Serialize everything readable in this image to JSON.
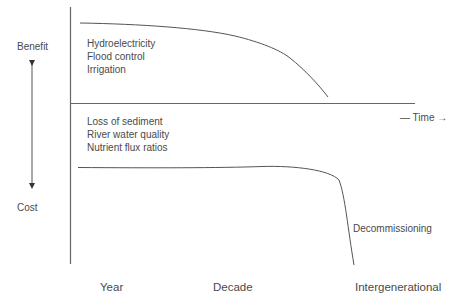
{
  "axis": {
    "y_top_label": "Benefit",
    "y_bottom_label": "Cost",
    "x_label": "— Time →"
  },
  "benefits": {
    "items": [
      "Hydroelectricity",
      "Flood control",
      "Irrigation"
    ]
  },
  "costs": {
    "items": [
      "Loss of sediment",
      "River water quality",
      "Nutrient flux ratios"
    ]
  },
  "annotations": {
    "decommissioning": "Decommissioning"
  },
  "time_scale": {
    "ticks": [
      "Year",
      "Decade",
      "Intergenerational"
    ]
  },
  "colors": {
    "line": "#5a5a5a",
    "text": "#4a4a4a",
    "background": "#ffffff"
  }
}
